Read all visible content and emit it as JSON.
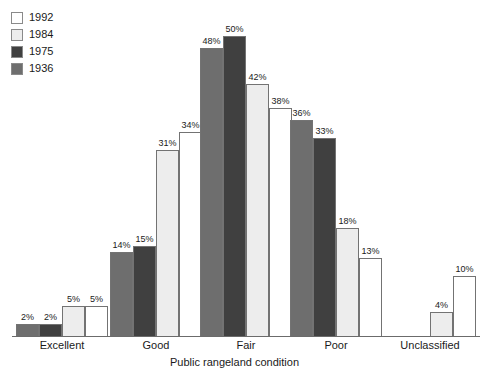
{
  "chart_data": {
    "type": "bar",
    "title": "",
    "xlabel": "Public rangeland condition",
    "ylabel": "",
    "ylim": [
      0,
      50
    ],
    "grid": false,
    "legend_position": "top-left",
    "value_suffix": "%",
    "categories": [
      "Excellent",
      "Good",
      "Fair",
      "Poor",
      "Unclassified"
    ],
    "series": [
      {
        "name": "1936",
        "color": "#6e6e6e",
        "values": [
          2,
          14,
          48,
          36,
          null
        ]
      },
      {
        "name": "1975",
        "color": "#404040",
        "values": [
          2,
          15,
          50,
          33,
          null
        ]
      },
      {
        "name": "1984",
        "color": "#ededed",
        "values": [
          5,
          31,
          42,
          18,
          4
        ]
      },
      {
        "name": "1992",
        "color": "#ffffff",
        "values": [
          5,
          34,
          38,
          13,
          10
        ]
      }
    ]
  },
  "legend": {
    "items": [
      {
        "label": "1992",
        "color": "#ffffff"
      },
      {
        "label": "1984",
        "color": "#ededed"
      },
      {
        "label": "1975",
        "color": "#404040"
      },
      {
        "label": "1936",
        "color": "#6e6e6e"
      }
    ]
  },
  "axis": {
    "title": "Public rangeland condition"
  }
}
